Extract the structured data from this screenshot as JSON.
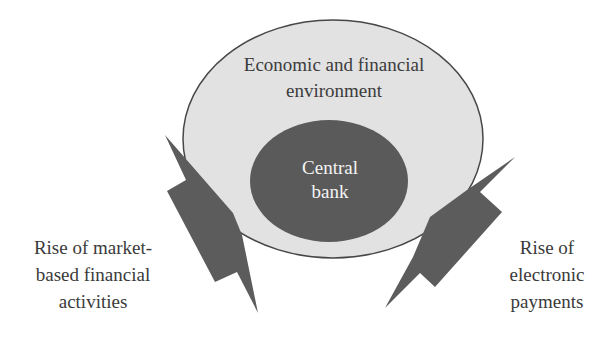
{
  "diagram": {
    "outer": {
      "lines": [
        "Economic and financial",
        "environment"
      ],
      "fill": "#e2e2e2",
      "stroke": "#474747"
    },
    "inner": {
      "lines": [
        "Central",
        "bank"
      ],
      "fill": "#5a5a5a"
    },
    "left_force": {
      "lines": [
        "Rise of market-",
        "based financial",
        "activities"
      ],
      "fill": "#5c5c5c"
    },
    "right_force": {
      "lines": [
        "Rise of",
        "electronic",
        "payments"
      ],
      "fill": "#5c5c5c"
    }
  }
}
